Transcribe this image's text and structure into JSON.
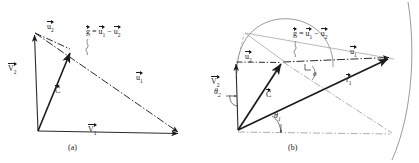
{
  "figure": {
    "background": "#ffffff",
    "ink": "#1a1a1a",
    "width": 419,
    "height": 163,
    "panels": [
      {
        "id": "a",
        "caption": "(a)",
        "labels": [
          {
            "name": "u2",
            "base": "u",
            "sub": "2",
            "vector": true,
            "x": 47,
            "y": 22
          },
          {
            "name": "v2",
            "base": "V",
            "sub": "2",
            "vector": true,
            "x": 8,
            "y": 64
          },
          {
            "name": "c",
            "base": "C",
            "sub": "",
            "vector": true,
            "x": 55,
            "y": 86
          },
          {
            "name": "u1",
            "base": "u",
            "sub": "1",
            "vector": true,
            "x": 136,
            "y": 73
          },
          {
            "name": "v1",
            "base": "V",
            "sub": "1",
            "vector": true,
            "x": 88,
            "y": 125
          }
        ],
        "equation": {
          "text_g": "g",
          "text_eq": "=",
          "text_u1": "u",
          "sub_u1": "1",
          "text_minus": "−",
          "text_u2": "u",
          "sub_u2": "2",
          "x": 89,
          "y": 35
        }
      },
      {
        "id": "b",
        "caption": "(b)",
        "labels": [
          {
            "name": "u2",
            "base": "u",
            "sub": "2",
            "vector": true,
            "x": 245,
            "y": 52
          },
          {
            "name": "v2",
            "base": "V",
            "sub": "2",
            "vector": true,
            "x": 212,
            "y": 77
          },
          {
            "name": "c",
            "base": "C",
            "sub": "",
            "vector": true,
            "x": 267,
            "y": 90
          },
          {
            "name": "u1",
            "base": "u",
            "sub": "1",
            "vector": true,
            "x": 351,
            "y": 47
          },
          {
            "name": "r1",
            "base": "r",
            "sub": "1",
            "vector": true,
            "x": 347,
            "y": 75
          }
        ],
        "equation": {
          "text_g": "g",
          "text_eq": "=",
          "text_u1": "u",
          "sub_u1": "1",
          "text_minus": "−",
          "text_u2": "u",
          "sub_u2": "2",
          "x": 296,
          "y": 37
        },
        "angles": [
          {
            "name": "theta2",
            "symbol": "θ",
            "sub": "2",
            "x": 216,
            "y": 92
          },
          {
            "name": "theta1",
            "symbol": "θ",
            "sub": "1",
            "x": 276,
            "y": 116
          },
          {
            "name": "psi",
            "symbol": "θ",
            "sub": "",
            "x": 313,
            "y": 72
          }
        ]
      }
    ]
  }
}
